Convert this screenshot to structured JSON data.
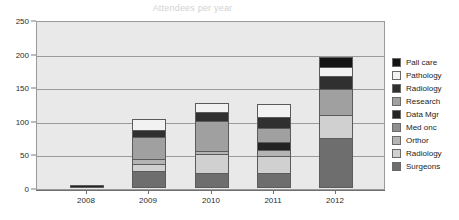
{
  "chart_data": {
    "type": "bar",
    "subtype": "stacked-bar",
    "title": "Attendees per year",
    "xlabel": "",
    "ylabel": "",
    "ylim": [
      0,
      250
    ],
    "ytick_step": 50,
    "ytick_labels": [
      "0",
      "50",
      "100",
      "150",
      "200",
      "250"
    ],
    "grid": true,
    "legend_position": "right",
    "categories": [
      "2008",
      "2009",
      "2010",
      "2011",
      "2012"
    ],
    "series": [
      {
        "name": "Surgeons",
        "color": "#6e6e6e",
        "values": [
          0,
          25,
          22,
          22,
          75
        ]
      },
      {
        "name": "Radiology",
        "color": "#d0d0d0",
        "values": [
          0,
          10,
          29,
          25,
          33
        ]
      },
      {
        "name": "Orthor",
        "color": "#b4b4b4",
        "values": [
          0,
          8,
          4,
          9,
          0
        ]
      },
      {
        "name": "Med onc",
        "color": "#8f8f8f",
        "values": [
          0,
          0,
          0,
          0,
          0
        ]
      },
      {
        "name": "Data Mgr",
        "color": "#232323",
        "values": [
          5,
          0,
          0,
          13,
          0
        ]
      },
      {
        "name": "Research",
        "color": "#a0a0a0",
        "values": [
          0,
          33,
          45,
          20,
          40
        ]
      },
      {
        "name": "Radiology",
        "color": "#303030",
        "values": [
          0,
          11,
          13,
          17,
          18
        ]
      },
      {
        "name": "Pathology",
        "color": "#f2f2f2",
        "values": [
          0,
          16,
          13,
          19,
          14
        ]
      },
      {
        "name": "Pall care",
        "color": "#141414",
        "values": [
          0,
          0,
          0,
          0,
          15
        ]
      }
    ],
    "totals": [
      5,
      103,
      126,
      125,
      195
    ],
    "annotations": []
  },
  "legend": {
    "items": [
      {
        "label": "Pall care",
        "color": "#141414"
      },
      {
        "label": "Pathology",
        "color": "#f2f2f2"
      },
      {
        "label": "Radiology",
        "color": "#303030"
      },
      {
        "label": "Research",
        "color": "#a0a0a0"
      },
      {
        "label": "Data Mgr",
        "color": "#232323"
      },
      {
        "label": "Med onc",
        "color": "#8f8f8f"
      },
      {
        "label": "Orthor",
        "color": "#b4b4b4"
      },
      {
        "label": "Radiology",
        "color": "#d0d0d0"
      },
      {
        "label": "Surgeons",
        "color": "#6e6e6e"
      }
    ]
  },
  "style": {
    "plot_background": "#e9e9e9",
    "grid_color": "#9a9a9a",
    "axis_color": "#6f6f6f",
    "title_color": "#d2d2d2",
    "text_color": "#1d1d1d"
  }
}
